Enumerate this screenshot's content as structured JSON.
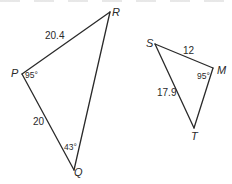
{
  "diagram": {
    "type": "geometry-triangles",
    "line_color": "#2a2a2a",
    "triangles": [
      {
        "name": "PQR",
        "vertices": {
          "P": {
            "label": "P",
            "x": 22,
            "y": 74
          },
          "Q": {
            "label": "Q",
            "x": 74,
            "y": 170
          },
          "R": {
            "label": "R",
            "x": 110,
            "y": 12
          }
        },
        "sides": [
          {
            "from": "P",
            "to": "R",
            "label": "20.4"
          },
          {
            "from": "P",
            "to": "Q",
            "label": "20"
          },
          {
            "from": "Q",
            "to": "R",
            "label": ""
          }
        ],
        "angles": [
          {
            "at": "P",
            "label": "95°"
          },
          {
            "at": "Q",
            "label": "43°"
          }
        ]
      },
      {
        "name": "SMT",
        "vertices": {
          "S": {
            "label": "S",
            "x": 155,
            "y": 44
          },
          "M": {
            "label": "M",
            "x": 213,
            "y": 68
          },
          "T": {
            "label": "T",
            "x": 194,
            "y": 128
          }
        },
        "sides": [
          {
            "from": "S",
            "to": "M",
            "label": "12"
          },
          {
            "from": "S",
            "to": "T",
            "label": "17.9"
          },
          {
            "from": "M",
            "to": "T",
            "label": ""
          }
        ],
        "angles": [
          {
            "at": "M",
            "label": "95°"
          }
        ]
      }
    ]
  },
  "labels": {
    "R": "R",
    "P": "P",
    "Q": "Q",
    "S": "S",
    "M": "M",
    "T": "T",
    "side_PR": "20.4",
    "side_PQ": "20",
    "side_SM": "12",
    "side_ST": "17.9",
    "angle_P": "95°",
    "angle_Q": "43°",
    "angle_M": "95°"
  }
}
